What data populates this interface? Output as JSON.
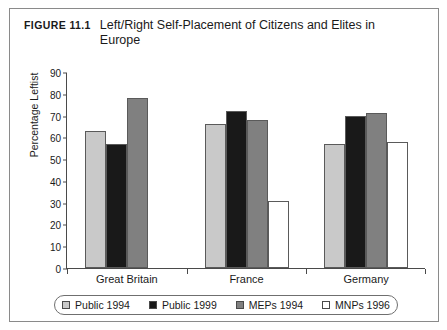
{
  "figure": {
    "number": "Figure 11.1",
    "title": "Left/Right Self-Placement of Citizens and Elites in Europe"
  },
  "chart_data": {
    "type": "bar",
    "title": "Left/Right Self-Placement of Citizens and Elites in Europe",
    "xlabel": "",
    "ylabel": "Percentage Leftist",
    "ylim": [
      0,
      90
    ],
    "yticks": [
      0,
      10,
      20,
      30,
      40,
      50,
      60,
      70,
      80,
      90
    ],
    "grid": false,
    "legend_position": "bottom",
    "categories": [
      "Great Britain",
      "France",
      "Germany"
    ],
    "series": [
      {
        "name": "Public 1994",
        "color": "#c9c9c9",
        "values": [
          63,
          66,
          57
        ]
      },
      {
        "name": "Public 1999",
        "color": "#191919",
        "values": [
          57,
          72,
          70
        ]
      },
      {
        "name": "MEPs 1994",
        "color": "#808080",
        "values": [
          78,
          68,
          71
        ]
      },
      {
        "name": "MNPs 1996",
        "color": "#ffffff",
        "values": [
          null,
          31,
          58
        ]
      }
    ]
  },
  "legend": {
    "items": [
      {
        "label": "Public 1994",
        "color": "#c9c9c9"
      },
      {
        "label": "Public 1999",
        "color": "#191919"
      },
      {
        "label": "MEPs 1994",
        "color": "#808080"
      },
      {
        "label": "MNPs 1996",
        "color": "#ffffff"
      }
    ]
  }
}
